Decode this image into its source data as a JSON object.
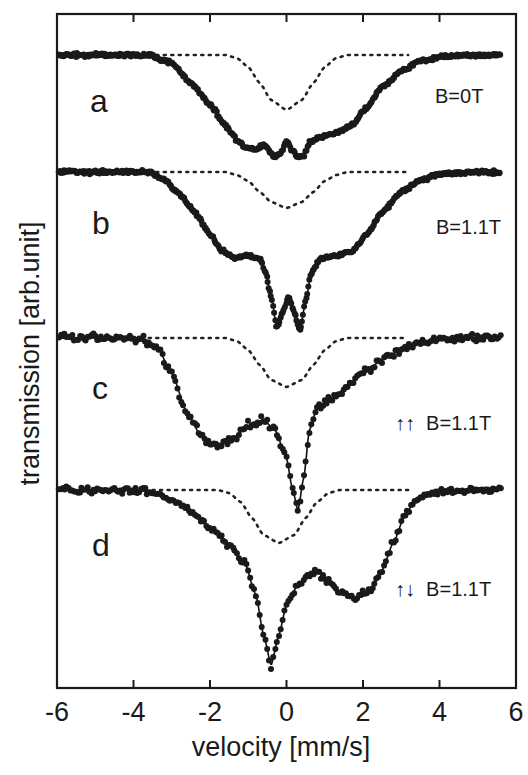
{
  "chart_data": {
    "type": "scatter",
    "title": "",
    "xlabel": "velocity [mm/s]",
    "ylabel": "transmission [arb.unit]",
    "xlim": [
      -6,
      6
    ],
    "xticks": [
      -6,
      -4,
      -2,
      0,
      2,
      4,
      6
    ],
    "yticks": [],
    "grid": false,
    "legend": null,
    "panels": [
      {
        "label": "a",
        "annotation": "B=0T",
        "baseline_px": 55,
        "scatter_noise": 2.5,
        "dense": true,
        "solid": {
          "x": [
            -6,
            -3.6,
            -3,
            -2.5,
            -2,
            -1.6,
            -1.3,
            -1.1,
            -0.8,
            -0.6,
            -0.45,
            -0.3,
            -0.15,
            0,
            0.15,
            0.3,
            0.45,
            0.6,
            0.9,
            1.3,
            1.7,
            2.1,
            2.5,
            3,
            3.5,
            4,
            5,
            5.6
          ],
          "y": [
            0,
            0,
            -8,
            -28,
            -50,
            -70,
            -85,
            -92,
            -94,
            -90,
            -96,
            -102,
            -98,
            -85,
            -95,
            -103,
            -100,
            -88,
            -82,
            -78,
            -70,
            -52,
            -32,
            -16,
            -6,
            -2,
            0,
            0
          ]
        },
        "dotted": {
          "x": [
            -6,
            -1.6,
            -1.3,
            -1,
            -0.7,
            -0.4,
            0,
            0.4,
            0.7,
            1,
            1.3,
            1.6,
            3.2
          ],
          "y": [
            0,
            0,
            -3,
            -12,
            -28,
            -45,
            -55,
            -45,
            -28,
            -12,
            -3,
            0,
            0
          ]
        },
        "dotted_range": [
          -3.6,
          3.2
        ]
      },
      {
        "label": "b",
        "annotation": "B=1.1T",
        "baseline_px": 172,
        "scatter_noise": 2.5,
        "dense": true,
        "solid": {
          "x": [
            -6,
            -3.6,
            -3.2,
            -2.8,
            -2.4,
            -2,
            -1.7,
            -1.4,
            -1,
            -0.7,
            -0.55,
            -0.4,
            -0.25,
            -0.1,
            0.05,
            0.2,
            0.35,
            0.5,
            0.65,
            0.9,
            1.3,
            1.7,
            2.1,
            2.5,
            3,
            3.5,
            4,
            5,
            5.6
          ],
          "y": [
            0,
            0,
            -8,
            -22,
            -40,
            -62,
            -78,
            -85,
            -84,
            -86,
            -100,
            -125,
            -156,
            -140,
            -125,
            -140,
            -158,
            -130,
            -100,
            -86,
            -84,
            -80,
            -62,
            -40,
            -20,
            -8,
            -2,
            0,
            0
          ]
        },
        "dotted": {
          "x": [
            -6,
            -1.6,
            -1.3,
            -1,
            -0.7,
            -0.4,
            0,
            0.4,
            0.7,
            1,
            1.3,
            1.6,
            3.2
          ],
          "y": [
            0,
            0,
            -3,
            -9,
            -20,
            -30,
            -36,
            -30,
            -20,
            -9,
            -3,
            0,
            0
          ]
        },
        "dotted_range": [
          -3.6,
          3.2
        ]
      },
      {
        "label": "c",
        "annotation_arrows": "↑↑",
        "annotation": "B=1.1T",
        "baseline_px": 338,
        "scatter_noise": 6,
        "dense": false,
        "solid": {
          "x": [
            -6,
            -3.8,
            -3.4,
            -3,
            -2.6,
            -2.2,
            -1.8,
            -1.4,
            -1,
            -0.6,
            -0.3,
            0,
            0.15,
            0.3,
            0.45,
            0.6,
            0.8,
            1.2,
            1.6,
            2,
            2.5,
            3,
            3.5,
            4,
            5,
            5.6
          ],
          "y": [
            0,
            0,
            -8,
            -35,
            -75,
            -100,
            -109,
            -100,
            -88,
            -82,
            -92,
            -120,
            -150,
            -172,
            -140,
            -92,
            -70,
            -60,
            -48,
            -35,
            -22,
            -12,
            -5,
            -2,
            0,
            0
          ]
        },
        "dotted": {
          "x": [
            -6,
            -1.6,
            -1.3,
            -1,
            -0.7,
            -0.4,
            0,
            0.4,
            0.7,
            1,
            1.3,
            1.6,
            3.2
          ],
          "y": [
            0,
            0,
            -3,
            -12,
            -27,
            -42,
            -49,
            -42,
            -27,
            -12,
            -3,
            0,
            0
          ]
        },
        "dotted_range": [
          -3.6,
          3.2
        ]
      },
      {
        "label": "d",
        "annotation_arrows": "↑↓",
        "annotation": "B=1.1T",
        "baseline_px": 490,
        "scatter_noise": 5,
        "dense": false,
        "solid": {
          "x": [
            -6,
            -4,
            -3.5,
            -3,
            -2.5,
            -2,
            -1.5,
            -1.1,
            -0.8,
            -0.6,
            -0.4,
            -0.2,
            0,
            0.3,
            0.6,
            0.8,
            1.1,
            1.4,
            1.8,
            2.2,
            2.5,
            2.8,
            3.1,
            3.4,
            3.8,
            5,
            5.6
          ],
          "y": [
            0,
            0,
            -2,
            -10,
            -22,
            -38,
            -55,
            -72,
            -105,
            -145,
            -175,
            -145,
            -115,
            -95,
            -85,
            -82,
            -92,
            -102,
            -108,
            -100,
            -80,
            -52,
            -25,
            -8,
            -2,
            0,
            0
          ]
        },
        "dotted": {
          "x": [
            -6,
            -1.8,
            -1.5,
            -1.2,
            -0.9,
            -0.6,
            -0.2,
            0.2,
            0.5,
            0.8,
            1.1,
            1.4,
            3.2
          ],
          "y": [
            0,
            0,
            -3,
            -12,
            -28,
            -45,
            -53,
            -45,
            -28,
            -12,
            -3,
            0,
            0
          ]
        },
        "dotted_range": [
          -3.5,
          3.2
        ]
      }
    ]
  },
  "axes": {
    "xtick_labels": [
      "-6",
      "-4",
      "-2",
      "0",
      "2",
      "4",
      "6"
    ],
    "xlabel": "velocity [mm/s]",
    "ylabel": "transmission [arb.unit]"
  },
  "panels": [
    {
      "letter": "a",
      "field": "B=0T"
    },
    {
      "letter": "b",
      "field": "B=1.1T"
    },
    {
      "letter": "c",
      "field": "↑↑  B=1.1T"
    },
    {
      "letter": "d",
      "field": "↑↓  B=1.1T"
    }
  ]
}
